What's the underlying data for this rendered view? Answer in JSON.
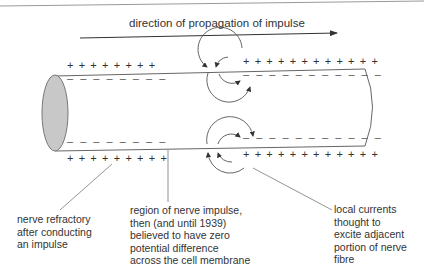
{
  "diagram": {
    "direction_label": "direction of propagation of impulse",
    "signs": {
      "left_top_plus": "+ + + + + + + +",
      "left_top_minus": "– – – – – – – –",
      "left_bottom_minus": "– – – – – – – –",
      "left_bottom_plus": "+ + + + + + + + +",
      "right_top_plus": "+ + + + + + + + + + + +",
      "right_top_minus": "– – – – – – – – – – –",
      "right_bottom_minus": "– – – – – – – – – – –",
      "right_bottom_plus": "+ + + + + + + + + + + +"
    },
    "labels": {
      "refractory": [
        "nerve refractory",
        "after conducting",
        "an impulse"
      ],
      "impulse_region": [
        "region of nerve impulse,",
        "then (and until 1939)",
        "believed to have zero",
        "potential difference",
        "across the cell membrane"
      ],
      "local_currents": [
        "local currents",
        "thought to",
        "excite adjacent",
        "portion of nerve",
        "fibre"
      ]
    },
    "colors": {
      "line": "#555555",
      "end_fill": "#c8c8c8"
    }
  }
}
